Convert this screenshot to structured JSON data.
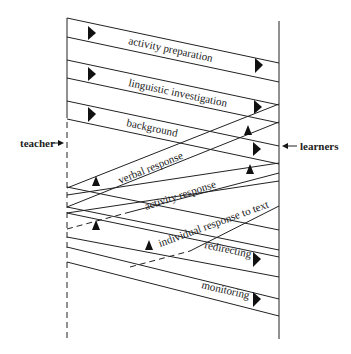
{
  "diagram": {
    "participants": {
      "left": "teacher",
      "right": "learners"
    },
    "bands": [
      {
        "label": "activity preparation",
        "direction": "teacher-to-learners"
      },
      {
        "label": "linguistic investigation",
        "direction": "teacher-to-learners"
      },
      {
        "label": "background",
        "direction": "teacher-to-learners"
      },
      {
        "label": "verbal response",
        "direction": "learners-to-teacher"
      },
      {
        "label": "activity response",
        "direction": "learners-to-teacher"
      },
      {
        "label": "individual response to text",
        "direction": "learners-to-teacher"
      },
      {
        "label": "redirecting",
        "direction": "teacher-to-learners"
      },
      {
        "label": "monitoring",
        "direction": "teacher-to-learners"
      }
    ],
    "colors": {
      "line": "#222222",
      "arrow": "#111111",
      "background": "#ffffff"
    }
  }
}
